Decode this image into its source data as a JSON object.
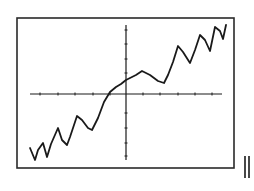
{
  "chart_data": {
    "type": "line",
    "title": "",
    "xlabel": "",
    "ylabel": "",
    "grid": false,
    "legend": null,
    "axes": {
      "x_axis_range_px": [
        30,
        222
      ],
      "y_axis_range_px": [
        25,
        160
      ],
      "origin_px": [
        126,
        94
      ],
      "x_ticks_px": [
        40,
        58,
        75,
        93,
        110,
        143,
        160,
        178,
        195,
        212
      ],
      "y_ticks_px": [
        30,
        44,
        59,
        73,
        113,
        128,
        143,
        156
      ]
    },
    "x": [
      -8.6,
      -8.1,
      -7.8,
      -7.3,
      -6.9,
      -6.5,
      -5.8,
      -5.4,
      -4.9,
      -4.6,
      -3.9,
      -3.4,
      -2.8,
      -2.4,
      -1.8,
      -1.2,
      -0.6,
      -0.0,
      0.0,
      1.0,
      1.6,
      2.4,
      3.2,
      3.8,
      4.2,
      4.7,
      5.2,
      5.7,
      6.4,
      6.9,
      7.4,
      7.9,
      8.4,
      8.9,
      9.4,
      9.7,
      10.0
    ],
    "series": [
      {
        "name": "curve",
        "values": [
          -3.8,
          -4.8,
          -4.0,
          -3.4,
          -4.6,
          -3.5,
          -2.2,
          -3.2,
          -3.7,
          -3.0,
          -1.3,
          -1.7,
          -2.3,
          -2.5,
          -1.5,
          -0.2,
          0.2,
          0.6,
          1.1,
          1.5,
          1.9,
          1.5,
          1.1,
          0.9,
          1.5,
          2.6,
          3.9,
          3.4,
          2.5,
          3.6,
          4.8,
          4.4,
          3.5,
          5.5,
          5.2,
          4.5,
          5.7
        ]
      }
    ],
    "polyline_px": [
      [
        30,
        148
      ],
      [
        35,
        160
      ],
      [
        38,
        150
      ],
      [
        43,
        143
      ],
      [
        47,
        157
      ],
      [
        51,
        144
      ],
      [
        58,
        128
      ],
      [
        62,
        140
      ],
      [
        67,
        145
      ],
      [
        70,
        137
      ],
      [
        77,
        116
      ],
      [
        82,
        120
      ],
      [
        88,
        128
      ],
      [
        92,
        130
      ],
      [
        98,
        118
      ],
      [
        104,
        102
      ],
      [
        110,
        92
      ],
      [
        116,
        87
      ],
      [
        121,
        84
      ],
      [
        126,
        80
      ],
      [
        136,
        75
      ],
      [
        142,
        71
      ],
      [
        150,
        75
      ],
      [
        158,
        81
      ],
      [
        164,
        83
      ],
      [
        168,
        75
      ],
      [
        173,
        62
      ],
      [
        178,
        46
      ],
      [
        183,
        52
      ],
      [
        190,
        63
      ],
      [
        195,
        50
      ],
      [
        200,
        35
      ],
      [
        205,
        40
      ],
      [
        210,
        51
      ],
      [
        215,
        27
      ],
      [
        220,
        31
      ],
      [
        223,
        39
      ],
      [
        226,
        25
      ]
    ],
    "frame_px": {
      "left": 17,
      "top": 18,
      "right": 234,
      "bottom": 168
    }
  },
  "colors": {
    "ink": "#1a1a1a",
    "frame": "#2a2a2a",
    "background": "#ffffff"
  },
  "decorations": {
    "double_bar": {
      "x1": 245,
      "x2": 249,
      "y_top": 156,
      "y_bottom": 178
    }
  }
}
